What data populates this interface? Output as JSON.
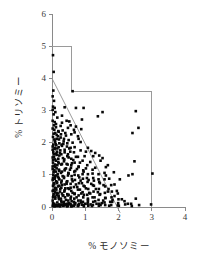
{
  "chart_data": {
    "type": "scatter",
    "title": "",
    "xlabel": "% モノソミー",
    "ylabel": "% トリソミー",
    "xlim": [
      0,
      4
    ],
    "ylim": [
      0,
      6
    ],
    "xticks": [
      0,
      1,
      2,
      3,
      4
    ],
    "yticks": [
      0,
      1,
      2,
      3,
      4,
      5,
      6
    ],
    "xtick_labels": [
      "0",
      "1",
      "2",
      "3",
      "4"
    ],
    "ytick_labels": [
      "0",
      "1",
      "2",
      "3",
      "4",
      "5",
      "6"
    ],
    "grid": false,
    "legend": null,
    "marker": "square",
    "marker_color": "#080808",
    "marker_size": 2.6,
    "annotations": [
      {
        "name": "step-boundary",
        "type": "polyline",
        "color": "#9a9a9a",
        "points": [
          [
            0,
            5.0
          ],
          [
            0.6,
            5.0
          ],
          [
            0.6,
            3.6
          ],
          [
            3.0,
            3.6
          ],
          [
            3.0,
            0
          ]
        ]
      },
      {
        "name": "regression-line",
        "type": "line",
        "color": "#8f8f8f",
        "points": [
          [
            0,
            4.0
          ],
          [
            2.05,
            -0.18
          ]
        ]
      }
    ],
    "points": [
      [
        0.03,
        4.72
      ],
      [
        0.05,
        4.2
      ],
      [
        0.04,
        3.62
      ],
      [
        0.02,
        3.44
      ],
      [
        0.06,
        3.3
      ],
      [
        0.03,
        3.12
      ],
      [
        0.08,
        3.08
      ],
      [
        0.02,
        3.02
      ],
      [
        0.1,
        2.95
      ],
      [
        0.05,
        2.88
      ],
      [
        0.62,
        3.6
      ],
      [
        0.38,
        3.1
      ],
      [
        0.72,
        3.08
      ],
      [
        0.95,
        3.08
      ],
      [
        1.52,
        2.95
      ],
      [
        2.52,
        2.98
      ],
      [
        1.38,
        2.82
      ],
      [
        0.9,
        2.72
      ],
      [
        0.52,
        2.66
      ],
      [
        0.3,
        2.62
      ],
      [
        0.12,
        2.58
      ],
      [
        0.06,
        2.54
      ],
      [
        2.6,
        2.46
      ],
      [
        2.42,
        2.3
      ],
      [
        0.72,
        2.5
      ],
      [
        0.48,
        2.46
      ],
      [
        0.88,
        2.42
      ],
      [
        0.66,
        2.4
      ],
      [
        0.32,
        2.38
      ],
      [
        0.2,
        2.34
      ],
      [
        0.1,
        2.3
      ],
      [
        0.05,
        2.28
      ],
      [
        0.58,
        2.26
      ],
      [
        0.42,
        2.22
      ],
      [
        0.78,
        2.2
      ],
      [
        0.26,
        2.16
      ],
      [
        0.14,
        2.12
      ],
      [
        0.07,
        2.1
      ],
      [
        0.5,
        2.08
      ],
      [
        0.35,
        2.04
      ],
      [
        0.62,
        2.0
      ],
      [
        0.22,
        1.98
      ],
      [
        0.11,
        1.96
      ],
      [
        0.04,
        1.94
      ],
      [
        0.3,
        1.9
      ],
      [
        0.45,
        1.88
      ],
      [
        0.68,
        1.86
      ],
      [
        0.16,
        1.82
      ],
      [
        0.08,
        1.8
      ],
      [
        0.02,
        1.78
      ],
      [
        0.86,
        1.76
      ],
      [
        1.18,
        1.74
      ],
      [
        0.55,
        1.72
      ],
      [
        0.38,
        1.7
      ],
      [
        0.24,
        1.68
      ],
      [
        0.13,
        1.66
      ],
      [
        0.06,
        1.64
      ],
      [
        1.42,
        1.6
      ],
      [
        0.98,
        1.58
      ],
      [
        0.72,
        1.56
      ],
      [
        0.5,
        1.54
      ],
      [
        0.33,
        1.52
      ],
      [
        0.19,
        1.5
      ],
      [
        0.09,
        1.48
      ],
      [
        0.03,
        1.46
      ],
      [
        2.48,
        1.42
      ],
      [
        1.15,
        1.4
      ],
      [
        0.84,
        1.38
      ],
      [
        0.6,
        1.36
      ],
      [
        0.44,
        1.34
      ],
      [
        0.28,
        1.32
      ],
      [
        0.16,
        1.3
      ],
      [
        0.07,
        1.28
      ],
      [
        0.02,
        1.26
      ],
      [
        1.62,
        1.24
      ],
      [
        1.3,
        1.22
      ],
      [
        1.02,
        1.2
      ],
      [
        0.75,
        1.18
      ],
      [
        0.54,
        1.16
      ],
      [
        0.38,
        1.14
      ],
      [
        0.22,
        1.12
      ],
      [
        0.12,
        1.1
      ],
      [
        0.05,
        1.08
      ],
      [
        3.02,
        1.04
      ],
      [
        2.42,
        1.02
      ],
      [
        2.3,
        0.98
      ],
      [
        1.58,
        1.06
      ],
      [
        1.22,
        1.04
      ],
      [
        0.92,
        1.02
      ],
      [
        0.68,
        1.0
      ],
      [
        0.48,
        0.98
      ],
      [
        0.32,
        0.96
      ],
      [
        0.18,
        0.94
      ],
      [
        0.09,
        0.92
      ],
      [
        0.03,
        0.9
      ],
      [
        1.72,
        0.88
      ],
      [
        1.4,
        0.86
      ],
      [
        1.1,
        0.84
      ],
      [
        0.86,
        0.82
      ],
      [
        0.62,
        0.8
      ],
      [
        0.44,
        0.78
      ],
      [
        0.28,
        0.76
      ],
      [
        0.15,
        0.74
      ],
      [
        0.06,
        0.72
      ],
      [
        1.88,
        0.7
      ],
      [
        1.55,
        0.68
      ],
      [
        1.26,
        0.66
      ],
      [
        0.98,
        0.64
      ],
      [
        0.76,
        0.62
      ],
      [
        0.56,
        0.6
      ],
      [
        0.4,
        0.58
      ],
      [
        0.25,
        0.56
      ],
      [
        0.13,
        0.54
      ],
      [
        0.05,
        0.52
      ],
      [
        1.95,
        0.5
      ],
      [
        1.68,
        0.48
      ],
      [
        1.38,
        0.46
      ],
      [
        1.12,
        0.44
      ],
      [
        0.88,
        0.42
      ],
      [
        0.68,
        0.4
      ],
      [
        0.5,
        0.38
      ],
      [
        0.34,
        0.36
      ],
      [
        0.2,
        0.34
      ],
      [
        0.1,
        0.32
      ],
      [
        0.03,
        0.3
      ],
      [
        2.52,
        0.26
      ],
      [
        2.1,
        0.24
      ],
      [
        1.82,
        0.22
      ],
      [
        1.54,
        0.2
      ],
      [
        1.3,
        0.18
      ],
      [
        1.08,
        0.16
      ],
      [
        0.88,
        0.14
      ],
      [
        0.7,
        0.12
      ],
      [
        0.54,
        0.1
      ],
      [
        0.4,
        0.08
      ],
      [
        0.28,
        0.06
      ],
      [
        0.18,
        0.05
      ],
      [
        0.1,
        0.04
      ],
      [
        0.04,
        0.03
      ],
      [
        2.98,
        0.08
      ],
      [
        2.62,
        0.06
      ],
      [
        2.28,
        0.1
      ],
      [
        1.98,
        0.05
      ],
      [
        1.72,
        0.04
      ],
      [
        1.46,
        0.06
      ],
      [
        1.2,
        0.03
      ],
      [
        0.96,
        0.02
      ],
      [
        0.78,
        0.05
      ],
      [
        0.6,
        0.03
      ],
      [
        0.46,
        0.02
      ],
      [
        0.34,
        0.04
      ],
      [
        0.24,
        0.02
      ],
      [
        0.15,
        0.03
      ],
      [
        0.08,
        0.02
      ],
      [
        0.02,
        0.04
      ],
      [
        0.16,
        2.78
      ],
      [
        0.26,
        2.52
      ],
      [
        0.4,
        2.3
      ],
      [
        0.18,
        2.2
      ],
      [
        0.09,
        2.02
      ],
      [
        0.34,
        1.96
      ],
      [
        0.52,
        1.82
      ],
      [
        0.25,
        1.76
      ],
      [
        0.14,
        1.62
      ],
      [
        0.46,
        1.58
      ],
      [
        0.64,
        1.46
      ],
      [
        0.36,
        1.42
      ],
      [
        0.2,
        1.36
      ],
      [
        0.1,
        1.24
      ],
      [
        0.58,
        1.3
      ],
      [
        0.8,
        1.26
      ],
      [
        0.42,
        1.2
      ],
      [
        0.3,
        1.1
      ],
      [
        0.17,
        1.02
      ],
      [
        0.08,
        0.96
      ],
      [
        0.7,
        1.12
      ],
      [
        0.95,
        1.1
      ],
      [
        0.5,
        1.04
      ],
      [
        0.36,
        0.9
      ],
      [
        0.22,
        0.86
      ],
      [
        0.12,
        0.8
      ],
      [
        0.06,
        0.74
      ],
      [
        0.82,
        0.92
      ],
      [
        1.05,
        0.9
      ],
      [
        0.6,
        0.86
      ],
      [
        0.44,
        0.72
      ],
      [
        0.3,
        0.68
      ],
      [
        0.18,
        0.64
      ],
      [
        0.08,
        0.6
      ],
      [
        0.9,
        0.74
      ],
      [
        1.18,
        0.72
      ],
      [
        0.72,
        0.7
      ],
      [
        0.52,
        0.56
      ],
      [
        0.38,
        0.52
      ],
      [
        0.24,
        0.48
      ],
      [
        0.14,
        0.44
      ],
      [
        0.05,
        0.4
      ],
      [
        1.02,
        0.58
      ],
      [
        1.32,
        0.56
      ],
      [
        0.84,
        0.54
      ],
      [
        0.62,
        0.44
      ],
      [
        0.46,
        0.4
      ],
      [
        0.32,
        0.36
      ],
      [
        0.2,
        0.3
      ],
      [
        0.1,
        0.26
      ],
      [
        1.15,
        0.42
      ],
      [
        1.45,
        0.4
      ],
      [
        0.96,
        0.38
      ],
      [
        0.74,
        0.3
      ],
      [
        0.56,
        0.26
      ],
      [
        0.42,
        0.22
      ],
      [
        0.28,
        0.18
      ],
      [
        0.16,
        0.14
      ],
      [
        0.07,
        0.1
      ],
      [
        1.28,
        0.3
      ],
      [
        1.6,
        0.28
      ],
      [
        1.08,
        0.26
      ],
      [
        0.86,
        0.2
      ],
      [
        0.66,
        0.16
      ],
      [
        0.5,
        0.12
      ],
      [
        0.36,
        0.1
      ],
      [
        0.22,
        0.08
      ],
      [
        0.12,
        0.06
      ],
      [
        0.04,
        0.08
      ],
      [
        1.75,
        0.16
      ],
      [
        1.5,
        0.12
      ],
      [
        1.34,
        0.1
      ],
      [
        1.16,
        0.08
      ],
      [
        1.0,
        0.1
      ],
      [
        0.9,
        0.07
      ],
      [
        0.8,
        0.06
      ],
      [
        0.68,
        0.08
      ],
      [
        0.58,
        0.06
      ],
      [
        0.48,
        0.07
      ],
      [
        0.38,
        0.05
      ],
      [
        0.3,
        0.06
      ],
      [
        0.2,
        0.04
      ],
      [
        0.13,
        0.05
      ],
      [
        0.06,
        0.06
      ],
      [
        0.02,
        2.68
      ],
      [
        0.02,
        2.44
      ],
      [
        0.03,
        2.18
      ],
      [
        0.02,
        1.88
      ],
      [
        0.04,
        1.7
      ],
      [
        0.02,
        1.54
      ],
      [
        0.03,
        1.38
      ],
      [
        0.02,
        1.18
      ],
      [
        0.04,
        1.0
      ],
      [
        0.02,
        0.84
      ],
      [
        0.03,
        0.66
      ],
      [
        0.02,
        0.5
      ],
      [
        0.04,
        0.34
      ],
      [
        0.02,
        0.2
      ],
      [
        0.03,
        0.12
      ],
      [
        0.08,
        2.64
      ],
      [
        0.07,
        2.4
      ],
      [
        0.09,
        2.06
      ],
      [
        0.08,
        1.84
      ],
      [
        0.06,
        1.56
      ],
      [
        0.09,
        1.32
      ],
      [
        0.07,
        1.14
      ],
      [
        0.08,
        0.88
      ],
      [
        0.06,
        0.7
      ],
      [
        0.09,
        0.46
      ],
      [
        0.12,
        2.48
      ],
      [
        0.14,
        2.24
      ],
      [
        0.13,
        1.92
      ],
      [
        0.15,
        1.72
      ],
      [
        0.12,
        1.44
      ],
      [
        0.14,
        1.2
      ],
      [
        0.13,
        0.98
      ],
      [
        0.15,
        0.78
      ],
      [
        0.12,
        0.58
      ],
      [
        0.14,
        0.38
      ],
      [
        0.19,
        2.36
      ],
      [
        0.21,
        2.1
      ],
      [
        0.2,
        1.86
      ],
      [
        0.22,
        1.6
      ],
      [
        0.19,
        1.4
      ],
      [
        0.21,
        1.16
      ],
      [
        0.2,
        0.9
      ],
      [
        0.22,
        0.66
      ],
      [
        0.19,
        0.42
      ],
      [
        0.21,
        0.24
      ],
      [
        0.27,
        2.26
      ],
      [
        0.29,
        1.94
      ],
      [
        0.28,
        1.64
      ],
      [
        0.3,
        1.34
      ],
      [
        0.27,
        1.06
      ],
      [
        0.29,
        0.82
      ],
      [
        0.28,
        0.6
      ],
      [
        0.3,
        0.42
      ],
      [
        0.27,
        0.26
      ],
      [
        0.29,
        0.14
      ],
      [
        0.36,
        2.12
      ],
      [
        0.38,
        1.78
      ],
      [
        0.37,
        1.48
      ],
      [
        0.39,
        1.18
      ],
      [
        0.36,
        0.94
      ],
      [
        0.38,
        0.7
      ],
      [
        0.37,
        0.48
      ],
      [
        0.39,
        0.3
      ],
      [
        0.36,
        0.16
      ],
      [
        0.38,
        0.08
      ],
      [
        0.46,
        1.98
      ],
      [
        0.48,
        1.64
      ],
      [
        0.47,
        1.32
      ],
      [
        0.49,
        1.06
      ],
      [
        0.46,
        0.8
      ],
      [
        0.48,
        0.58
      ],
      [
        0.47,
        0.36
      ],
      [
        0.49,
        0.2
      ],
      [
        0.46,
        0.1
      ],
      [
        0.48,
        0.04
      ],
      [
        0.56,
        1.84
      ],
      [
        0.58,
        1.5
      ],
      [
        0.57,
        1.22
      ],
      [
        0.59,
        0.96
      ],
      [
        0.56,
        0.72
      ],
      [
        0.58,
        0.5
      ],
      [
        0.57,
        0.32
      ],
      [
        0.59,
        0.18
      ],
      [
        0.56,
        0.08
      ],
      [
        0.58,
        0.02
      ],
      [
        0.66,
        1.7
      ],
      [
        0.68,
        1.38
      ],
      [
        0.67,
        1.1
      ],
      [
        0.69,
        0.84
      ],
      [
        0.66,
        0.62
      ],
      [
        0.68,
        0.42
      ],
      [
        0.67,
        0.26
      ],
      [
        0.69,
        0.12
      ],
      [
        0.66,
        0.04
      ],
      [
        0.78,
        1.56
      ],
      [
        0.8,
        1.24
      ],
      [
        0.79,
        0.98
      ],
      [
        0.81,
        0.74
      ],
      [
        0.78,
        0.54
      ],
      [
        0.8,
        0.36
      ],
      [
        0.79,
        0.2
      ],
      [
        0.81,
        0.1
      ],
      [
        0.78,
        0.03
      ],
      [
        0.92,
        1.44
      ],
      [
        0.94,
        1.14
      ],
      [
        0.93,
        0.88
      ],
      [
        0.95,
        0.66
      ],
      [
        0.92,
        0.46
      ],
      [
        0.94,
        0.3
      ],
      [
        0.93,
        0.16
      ],
      [
        0.95,
        0.06
      ],
      [
        1.06,
        1.3
      ],
      [
        1.08,
        1.02
      ],
      [
        1.07,
        0.78
      ],
      [
        1.09,
        0.56
      ],
      [
        1.06,
        0.38
      ],
      [
        1.08,
        0.22
      ],
      [
        1.07,
        0.1
      ],
      [
        1.09,
        0.04
      ],
      [
        1.22,
        1.16
      ],
      [
        1.24,
        0.9
      ],
      [
        1.23,
        0.68
      ],
      [
        1.25,
        0.48
      ],
      [
        1.22,
        0.3
      ],
      [
        1.24,
        0.16
      ],
      [
        1.23,
        0.06
      ],
      [
        1.4,
        1.02
      ],
      [
        1.42,
        0.78
      ],
      [
        1.41,
        0.56
      ],
      [
        1.43,
        0.38
      ],
      [
        1.4,
        0.22
      ],
      [
        1.42,
        0.1
      ],
      [
        1.41,
        0.04
      ],
      [
        1.58,
        0.86
      ],
      [
        1.6,
        0.64
      ],
      [
        1.59,
        0.44
      ],
      [
        1.61,
        0.28
      ],
      [
        1.58,
        0.14
      ],
      [
        1.6,
        0.06
      ],
      [
        1.78,
        0.68
      ],
      [
        1.8,
        0.48
      ],
      [
        1.79,
        0.3
      ],
      [
        1.81,
        0.16
      ],
      [
        1.78,
        0.06
      ],
      [
        1.98,
        0.42
      ],
      [
        2.0,
        0.24
      ],
      [
        1.99,
        0.12
      ],
      [
        2.01,
        0.04
      ],
      [
        2.18,
        0.18
      ],
      [
        2.2,
        0.08
      ],
      [
        2.38,
        0.1
      ],
      [
        2.4,
        0.03
      ],
      [
        1.52,
        1.52
      ],
      [
        1.3,
        1.68
      ],
      [
        1.08,
        1.84
      ],
      [
        0.86,
        2.02
      ],
      [
        1.68,
        1.3
      ],
      [
        1.86,
        1.08
      ],
      [
        2.04,
        0.86
      ],
      [
        1.46,
        1.44
      ],
      [
        1.24,
        1.58
      ],
      [
        1.02,
        1.72
      ],
      [
        1.62,
        0.98
      ],
      [
        1.44,
        0.74
      ],
      [
        1.26,
        0.82
      ],
      [
        1.7,
        0.56
      ],
      [
        1.88,
        0.34
      ],
      [
        0.44,
        2.68
      ],
      [
        0.56,
        2.54
      ],
      [
        0.68,
        2.32
      ],
      [
        0.8,
        2.12
      ],
      [
        0.3,
        2.84
      ]
    ]
  }
}
